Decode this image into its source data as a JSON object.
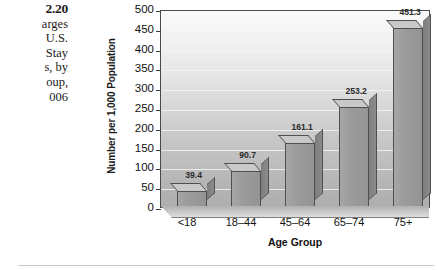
{
  "caption": {
    "figure_number": "2.20",
    "lines": [
      "arges",
      "U.S.",
      "Stay",
      "s, by",
      "oup,",
      "006"
    ]
  },
  "chart_data": {
    "type": "bar",
    "title": "",
    "categories": [
      "<18",
      "18–44",
      "45–64",
      "65–74",
      "75+"
    ],
    "values": [
      39.4,
      90.7,
      161.1,
      253.2,
      451.3
    ],
    "value_labels": [
      "39.4",
      "90.7",
      "161.1",
      "253.2",
      "451.3"
    ],
    "xlabel": "Age Group",
    "ylabel": "Number per 1,000 Population",
    "ylim": [
      0,
      500
    ],
    "yticks": [
      0,
      50,
      100,
      150,
      200,
      250,
      300,
      350,
      400,
      450,
      500
    ],
    "ytick_labels": [
      "0",
      "50",
      "100",
      "150",
      "200",
      "250",
      "300",
      "350",
      "400",
      "450",
      "500"
    ],
    "grid": true,
    "legend": "none",
    "style": "3d-bar",
    "colors": {
      "bar_front": "#9b9b9b",
      "bar_side": "#838383",
      "bar_top": "#c9c9c9",
      "bar_outline": "#4f4f4f",
      "gridline": "#f4f4f4",
      "plot_border": "#4a4a4a",
      "text": "#111111"
    }
  }
}
